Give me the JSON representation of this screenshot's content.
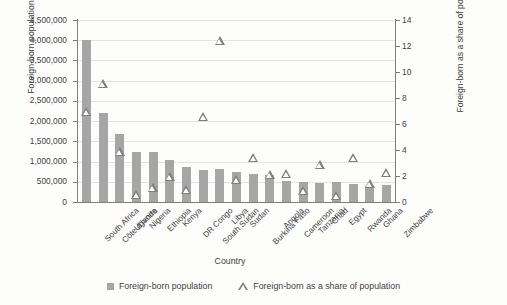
{
  "chart_data": {
    "type": "bar",
    "title": "",
    "xlabel": "Country",
    "ylabel": "Foreign-born  population",
    "y2label": "Foreign-born as a share of population (%)",
    "grid": true,
    "legend_position": "bottom",
    "ylim": [
      0,
      4500000
    ],
    "y2lim": [
      0,
      14
    ],
    "yticks": [
      "0",
      "500,000",
      "1,000,000",
      "1,500,000",
      "2,000,000",
      "2,500,000",
      "3,000,000",
      "3,500,000",
      "4,000,000",
      "4,500,000"
    ],
    "ytick_values": [
      0,
      500000,
      1000000,
      1500000,
      2000000,
      2500000,
      3000000,
      3500000,
      4000000,
      4500000
    ],
    "y2ticks": [
      "0",
      "2",
      "4",
      "6",
      "8",
      "10",
      "12",
      "14"
    ],
    "y2tick_values": [
      0,
      2,
      4,
      6,
      8,
      10,
      12,
      14
    ],
    "categories": [
      "South Africa",
      "Côte d'Ivoire",
      "Uganda",
      "Nigeria",
      "Ethiopia",
      "Kenya",
      "DR Congo",
      "South Sudan",
      "Libya",
      "Sudan",
      "Burkina Faso",
      "Angola",
      "Cameroon",
      "Tanzania",
      "Chad",
      "Egypt",
      "Rwanda",
      "Ghana",
      "Zimbabwe"
    ],
    "series": [
      {
        "name": "Foreign-born population",
        "type": "bar",
        "axis": "left",
        "color": "#a6a6a6",
        "values": [
          4000000,
          2200000,
          1680000,
          1240000,
          1230000,
          1050000,
          860000,
          800000,
          820000,
          740000,
          700000,
          660000,
          520000,
          500000,
          480000,
          500000,
          450000,
          400000,
          410000
        ]
      },
      {
        "name": "Foreign-born as a share of population",
        "type": "scatter",
        "axis": "right",
        "marker": "triangle-open",
        "color": "#808080",
        "values": [
          7.0,
          9.1,
          3.9,
          0.6,
          1.1,
          2.0,
          1.0,
          6.6,
          12.4,
          1.7,
          3.4,
          2.1,
          2.2,
          0.9,
          2.9,
          0.5,
          3.4,
          1.4,
          2.3
        ]
      }
    ]
  },
  "legend": {
    "items": [
      {
        "label": "Foreign-born population",
        "marker": "square"
      },
      {
        "label": "Foreign-born as a share of population",
        "marker": "triangle"
      }
    ]
  }
}
